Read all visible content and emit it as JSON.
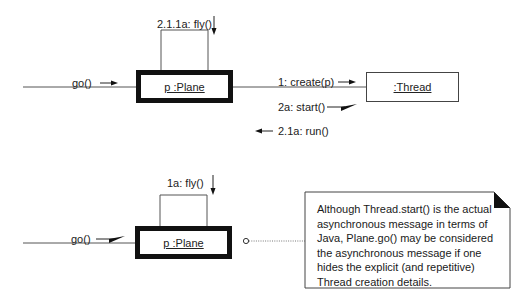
{
  "top_diagram": {
    "caller_message": "go()",
    "plane_object": "p :Plane",
    "self_message": "2.1.1a: fly()",
    "thread_object": ":Thread",
    "messages": [
      {
        "label": "1: create(p)",
        "direction": "to-thread",
        "kind": "synchronous"
      },
      {
        "label": "2a: start()",
        "direction": "to-thread",
        "kind": "asynchronous"
      },
      {
        "label": "2.1a: run()",
        "direction": "to-plane",
        "kind": "synchronous"
      }
    ]
  },
  "bottom_diagram": {
    "caller_message": "go()",
    "caller_message_kind": "asynchronous",
    "plane_object": "p :Plane",
    "self_message": "1a: fly()"
  },
  "note": {
    "text": "Although Thread.start() is the actual asynchronous message in terms of Java, Plane.go() may be considered the asynchronous message if one hides the explicit (and repetitive) Thread creation details."
  },
  "colors": {
    "line": "#555555",
    "active_border": "#111111",
    "arrow": "#111111"
  }
}
